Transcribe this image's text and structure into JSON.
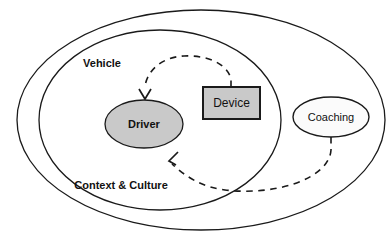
{
  "diagram": {
    "type": "nested-venn-influence-diagram",
    "background_color": "#ffffff",
    "stroke_color": "#1a1a1a",
    "containers": [
      {
        "id": "context-culture",
        "label": "Context & Culture",
        "shape": "ellipse",
        "fill": "#ffffff",
        "label_weight": "bold",
        "label_size": 11,
        "cx": 201,
        "cy": 120,
        "rx": 184,
        "ry": 110,
        "label_x": 121,
        "label_y": 186
      },
      {
        "id": "vehicle",
        "label": "Vehicle",
        "shape": "ellipse",
        "fill": "#ffffff",
        "label_weight": "bold",
        "label_size": 11,
        "cx": 160,
        "cy": 120,
        "rx": 121,
        "ry": 90,
        "label_x": 102,
        "label_y": 64
      }
    ],
    "nodes": [
      {
        "id": "driver",
        "label": "Driver",
        "shape": "ellipse",
        "fill": "#c9c9c9",
        "stroke": "#1a1a1a",
        "label_weight": "bold",
        "label_size": 11,
        "cx": 144,
        "cy": 124,
        "rx": 39,
        "ry": 24
      },
      {
        "id": "device",
        "label": "Device",
        "shape": "rectangle",
        "fill": "#c9c9c9",
        "stroke": "#1a1a1a",
        "label_weight": "normal",
        "label_size": 12,
        "x": 203,
        "y": 87,
        "width": 57,
        "height": 32
      },
      {
        "id": "coaching",
        "label": "Coaching",
        "shape": "ellipse",
        "fill": "#fbfbfb",
        "stroke": "#1a1a1a",
        "label_weight": "normal",
        "label_size": 11,
        "cx": 331,
        "cy": 117,
        "rx": 38,
        "ry": 20
      }
    ],
    "connectors": [
      {
        "id": "device-to-driver",
        "from": "device",
        "to": "driver",
        "style": "dashed",
        "arrowhead": "open-v",
        "direction": "device influences driver"
      },
      {
        "id": "coaching-to-driver",
        "from": "coaching",
        "to": "driver",
        "style": "dashed",
        "arrowhead": "open-v",
        "direction": "coaching influences driver"
      }
    ]
  }
}
